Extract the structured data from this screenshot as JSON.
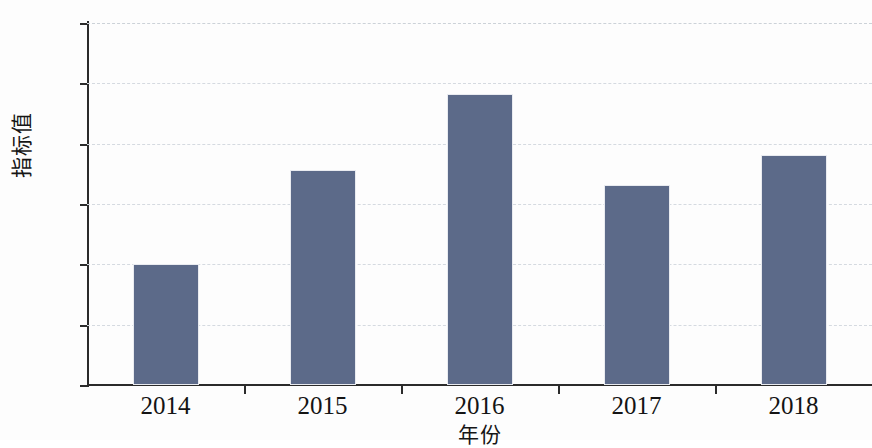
{
  "chart_data": {
    "type": "bar",
    "title": "",
    "subtitle": "",
    "xlabel": "年份",
    "ylabel": "指标值",
    "categories": [
      "2014",
      "2015",
      "2016",
      "2017",
      "2018"
    ],
    "values": [
      100.0,
      107.8,
      114.1,
      106.6,
      109.1
    ],
    "series": [
      {
        "name": "指标值",
        "values": [
          100.0,
          107.8,
          114.1,
          106.6,
          109.1
        ]
      }
    ],
    "ylim": [
      90,
      120
    ],
    "yticks": [
      90,
      95,
      100,
      105,
      110,
      115,
      120
    ],
    "ytick_labels": [
      "90",
      "95",
      "100",
      "105",
      "110",
      "115",
      "120"
    ],
    "xtick_labels": [
      "2014",
      "2015",
      "2016",
      "2017",
      "2018"
    ],
    "grid": "horizontal-dashed",
    "legend": "none",
    "bar_color": "#5c6a89",
    "grid_color": "#d5dae0",
    "axis_color": "#2b2b2b",
    "background": "#fdfdfd",
    "annotations": []
  }
}
